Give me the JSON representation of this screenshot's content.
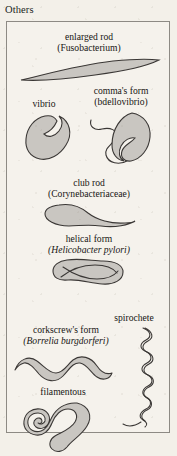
{
  "figure": {
    "section_title": "Others",
    "panel_border_color": "#8d8a84",
    "background_color": "#f3f0e9",
    "organism_fill_color": "#c9c6c1",
    "organism_outline_color": "#3a3735"
  },
  "items": [
    {
      "id": "enlarged-rod",
      "common_name": "enlarged rod",
      "taxon": "(Fusobacterium)",
      "taxon_italic": false,
      "shape": "spindle / fusiform rod tapering to points at both ends"
    },
    {
      "id": "vibrio",
      "common_name": "vibrio",
      "taxon": "",
      "taxon_italic": false,
      "shape": "curved comma / kidney-shaped cell"
    },
    {
      "id": "commas-form",
      "common_name": "comma's form",
      "taxon": "(bdellovibrio)",
      "taxon_italic": false,
      "shape": "teardrop comma cell with long wavy polar flagellum"
    },
    {
      "id": "club-rod",
      "common_name": "club rod",
      "taxon": "(Corynebacteriaceae)",
      "taxon_italic": false,
      "shape": "club shaped rod, bulbous at one end tapering to a tail"
    },
    {
      "id": "helical-form",
      "common_name": "helical form",
      "taxon": "(Helicobacter pylori)",
      "taxon_italic": true,
      "shape": "short twisted helical body"
    },
    {
      "id": "corkscrews-form",
      "common_name": "corkscrew's form",
      "taxon": "(Borrelia burgdorferi)",
      "taxon_italic": true,
      "shape": "thick undulating corkscrew ribbon with broad waves"
    },
    {
      "id": "spirochete",
      "common_name": "spirochete",
      "taxon": "",
      "taxon_italic": false,
      "shape": "long slender tightly coiled vertical spiral filament"
    },
    {
      "id": "filamentous",
      "common_name": "filamentous",
      "taxon": "",
      "taxon_italic": false,
      "shape": "long looping tangled filament forming overlapping coils"
    }
  ]
}
